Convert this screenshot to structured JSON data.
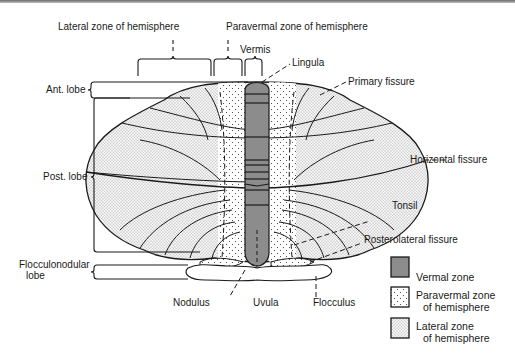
{
  "diagram": {
    "top_labels": {
      "lateral_zone": "Lateral zone of hemisphere",
      "paravermal_zone": "Paravermal zone of hemisphere",
      "vermis": "Vermis"
    },
    "left_labels": {
      "ant_lobe": "Ant. lobe",
      "post_lobe": "Post. lobe",
      "flocculonodular_line1": "Flocculonodular",
      "flocculonodular_line2": "lobe"
    },
    "right_labels": {
      "lingula": "Lingula",
      "primary_fissure": "Primary fissure",
      "horizontal_fissure": "Horizontal fissure",
      "tonsil": "Tonsil",
      "posterolateral_fissure": "Posterolateral fissure"
    },
    "bottom_labels": {
      "nodulus": "Nodulus",
      "uvula": "Uvula",
      "flocculus": "Flocculus"
    },
    "legend": [
      {
        "key": "vermal",
        "line1": "Vermal zone",
        "line2": "",
        "fill": "#8c8c8c"
      },
      {
        "key": "paravermal",
        "line1": "Paravermal zone",
        "line2": "of hemisphere",
        "fill": "sparse-dots"
      },
      {
        "key": "lateral",
        "line1": "Lateral zone",
        "line2": "of hemisphere",
        "fill": "dense-dots"
      }
    ],
    "colors": {
      "vermis": "#8c8c8c",
      "outline": "#1a1a1a",
      "top_border": "#7a7a7a"
    }
  }
}
